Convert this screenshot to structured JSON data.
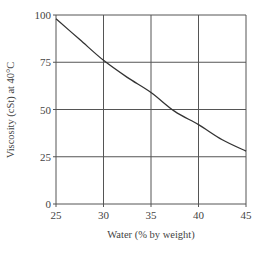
{
  "chart_data": {
    "type": "line",
    "title": "",
    "xlabel": "Water (% by weight)",
    "ylabel": "Viscosity (cSt) at 40°C",
    "xlim": [
      25,
      45
    ],
    "ylim": [
      0,
      100
    ],
    "xticks": [
      25,
      30,
      35,
      40,
      45
    ],
    "yticks": [
      0,
      25,
      50,
      75,
      100
    ],
    "grid": true,
    "legend": null,
    "series": [
      {
        "name": "Viscosity",
        "x": [
          25,
          27.5,
          30,
          32.5,
          35,
          37.5,
          40,
          42.5,
          45
        ],
        "y": [
          98,
          87,
          76,
          67,
          59,
          49,
          42,
          34,
          28
        ]
      }
    ]
  },
  "colors": {
    "grid": "#555555",
    "line": "#333333"
  }
}
